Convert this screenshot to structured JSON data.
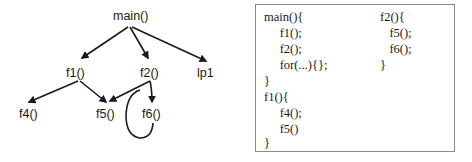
{
  "call_graph": {
    "nodes": {
      "main": {
        "label": "main()"
      },
      "f1": {
        "label": "f1()"
      },
      "f2": {
        "label": "f2()"
      },
      "lp1": {
        "label": "lp1"
      },
      "f4": {
        "label": "f4()"
      },
      "f5": {
        "label": "f5()"
      },
      "f6": {
        "label": "f6()"
      }
    },
    "edges": [
      {
        "from": "main()",
        "to": "f1()"
      },
      {
        "from": "main()",
        "to": "f2()"
      },
      {
        "from": "main()",
        "to": "lp1"
      },
      {
        "from": "f1()",
        "to": "f4()"
      },
      {
        "from": "f1()",
        "to": "f5()"
      },
      {
        "from": "f2()",
        "to": "f5()"
      },
      {
        "from": "f2()",
        "to": "f6()"
      },
      {
        "from": "f6()",
        "to": "f6()",
        "type": "self-loop"
      }
    ],
    "colors": {
      "stroke": "#1a1a1a",
      "text": "#1a1a1a"
    }
  },
  "code": {
    "left_column": [
      "main(){",
      "     f1();",
      "     f2();",
      "     for(...){};",
      "}",
      "f1(){",
      "     f4();",
      "     f5()",
      "}"
    ],
    "right_column": [
      "f2(){",
      "   f5();",
      "   f6();",
      "}"
    ],
    "border_color": "#8a8a8a"
  }
}
